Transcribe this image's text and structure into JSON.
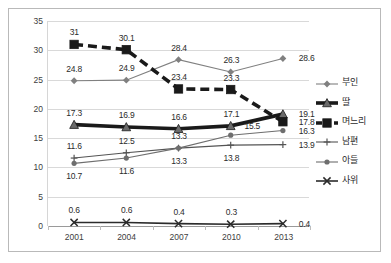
{
  "chart_data": {
    "type": "line",
    "title": "",
    "xlabel": "",
    "ylabel": "",
    "categories": [
      "2001",
      "2004",
      "2007",
      "2010",
      "2013"
    ],
    "ylim": [
      0,
      35
    ],
    "yticks": [
      "0",
      "5",
      "10",
      "15",
      "20",
      "25",
      "30",
      "35"
    ],
    "grid": true,
    "legend_position": "right",
    "series": [
      {
        "name": "부인",
        "marker": "diamond",
        "line_style": "solid",
        "line_width": "thin",
        "color": "#808080",
        "values": [
          24.8,
          24.9,
          28.4,
          26.3,
          28.6
        ],
        "labels": [
          "24.8",
          "24.9",
          "28.4",
          "26.3",
          "28.6"
        ]
      },
      {
        "name": "딸",
        "marker": "triangle",
        "line_style": "solid",
        "line_width": "thick",
        "color": "#1a1a1a",
        "values": [
          17.3,
          16.9,
          16.6,
          17.1,
          19.1
        ],
        "labels": [
          "17.3",
          "16.9",
          "16.6",
          "17.1",
          "19.1"
        ]
      },
      {
        "name": "며느리",
        "marker": "square",
        "line_style": "dashed",
        "line_width": "thick",
        "color": "#1a1a1a",
        "values": [
          31.0,
          30.1,
          23.4,
          23.3,
          17.8
        ],
        "labels": [
          "31",
          "30.1",
          "23.4",
          "23.3",
          "17.8"
        ]
      },
      {
        "name": "남편",
        "marker": "plus",
        "line_style": "solid",
        "line_width": "thin",
        "color": "#545454",
        "values": [
          11.6,
          12.5,
          13.3,
          13.8,
          13.9
        ],
        "labels": [
          "11.6",
          "12.5",
          "13.3",
          "13.8",
          "13.9"
        ]
      },
      {
        "name": "아들",
        "marker": "circle",
        "line_style": "solid",
        "line_width": "thin",
        "color": "#6e6e6e",
        "values": [
          10.7,
          11.6,
          13.3,
          15.5,
          16.3
        ],
        "labels": [
          "10.7",
          "11.6",
          "13.3",
          "15.5",
          "16.3"
        ]
      },
      {
        "name": "사위",
        "marker": "x",
        "line_style": "solid",
        "line_width": "medium",
        "color": "#2b2b2b",
        "values": [
          0.6,
          0.6,
          0.4,
          0.3,
          0.4
        ],
        "labels": [
          "0.6",
          "0.6",
          "0.4",
          "0.3",
          "0.4"
        ]
      }
    ],
    "label_offsets": [
      [
        [
          0,
          "up"
        ],
        [
          0,
          "up"
        ],
        [
          0,
          "up"
        ],
        [
          0,
          "up"
        ],
        [
          1,
          "right"
        ]
      ],
      [
        [
          0,
          "up"
        ],
        [
          0,
          "up"
        ],
        [
          0,
          "up"
        ],
        [
          0,
          "up"
        ],
        [
          1,
          "right"
        ]
      ],
      [
        [
          0,
          "up"
        ],
        [
          0,
          "up"
        ],
        [
          0,
          "up"
        ],
        [
          0,
          "up"
        ],
        [
          1,
          "right"
        ]
      ],
      [
        [
          0,
          "up"
        ],
        [
          0,
          "up"
        ],
        [
          0,
          "down"
        ],
        [
          0,
          "down"
        ],
        [
          1,
          "right"
        ]
      ],
      [
        [
          0,
          "down"
        ],
        [
          0,
          "down"
        ],
        [
          0,
          "up"
        ],
        [
          0,
          "upright"
        ],
        [
          1,
          "right"
        ]
      ],
      [
        [
          0,
          "up"
        ],
        [
          0,
          "up"
        ],
        [
          0,
          "up"
        ],
        [
          0,
          "up"
        ],
        [
          1,
          "right"
        ]
      ]
    ]
  }
}
